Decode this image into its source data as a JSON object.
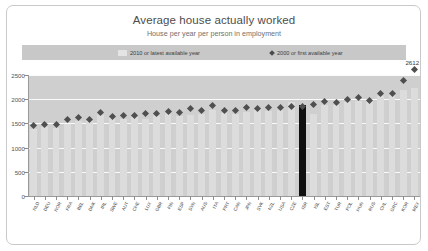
{
  "header": {
    "title": "Average house actually worked",
    "subtitle": "House per year per person in employment"
  },
  "legend": {
    "bar_label": "2010 or latest available year",
    "marker_label": "2000 or first available year",
    "bar_color": "#e4e4e4",
    "marker_color": "#4a4a4a"
  },
  "annotation": {
    "value_label": "2612"
  },
  "chart_data": {
    "type": "bar",
    "title": "Average house actually worked",
    "subtitle": "House per year per person in employment",
    "xlabel": "",
    "ylabel": "",
    "ylim": [
      0,
      2500
    ],
    "yticks": [
      0,
      500,
      1000,
      1500,
      2000,
      2500
    ],
    "grid": true,
    "legend_position": "top",
    "highlight_index": 24,
    "highlight_color": "#0f0f0f",
    "categories": [
      "NLD",
      "DEU",
      "NOR",
      "FRA",
      "BEL",
      "DNK",
      "IRL",
      "SWE",
      "AUT",
      "CHE",
      "LUX",
      "GBR",
      "FIN",
      "ESP",
      "SVN",
      "AUS",
      "ITA",
      "PRT",
      "CAN",
      "JPN",
      "SVK",
      "NZL",
      "USA",
      "CZE",
      "ISR",
      "ISL",
      "EST",
      "TUR",
      "POL",
      "HUN",
      "RUS",
      "CHL",
      "GRC",
      "KOR",
      "MEX"
    ],
    "series": [
      {
        "name": "2010 or latest available year",
        "color": "#dcdcdc",
        "values": [
          1377,
          1419,
          1414,
          1478,
          1551,
          1546,
          1664,
          1624,
          1587,
          1632,
          1601,
          1647,
          1697,
          1663,
          1664,
          1686,
          1773,
          1714,
          1702,
          1733,
          1786,
          1758,
          1778,
          1947,
          1889,
          1697,
          1879,
          1877,
          1939,
          1961,
          1976,
          2068,
          2109,
          2193,
          2242
        ]
      },
      {
        "name": "2000 or first available year",
        "color": "#4f4f4f",
        "values": [
          1462,
          1473,
          1480,
          1587,
          1613,
          1581,
          1719,
          1650,
          1665,
          1673,
          1697,
          1705,
          1751,
          1731,
          1807,
          1763,
          1861,
          1769,
          1775,
          1821,
          1816,
          1826,
          1836,
          1852,
          1857,
          1885,
          1954,
          1937,
          1988,
          2033,
          1981,
          2109,
          2121,
          2390,
          2612
        ]
      }
    ]
  }
}
